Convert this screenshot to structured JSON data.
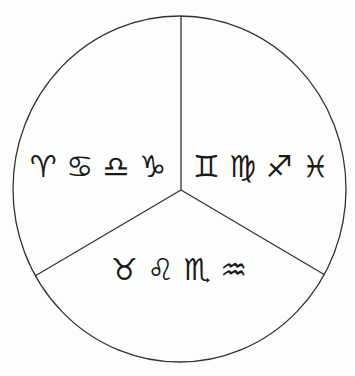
{
  "diagram": {
    "colors": {
      "background": "#fdfdfd",
      "stroke": "#333333",
      "glyph": "#1a1a1a"
    },
    "sectors": [
      {
        "position": "upper-left",
        "glyphs": "♈︎ ♋︎ ♎︎ ♑︎",
        "signs": [
          "Aries",
          "Cancer",
          "Libra",
          "Capricorn"
        ]
      },
      {
        "position": "upper-right",
        "glyphs": "♊︎ ♍︎ ♐︎ ♓︎",
        "signs": [
          "Gemini",
          "Virgo",
          "Sagittarius",
          "Pisces"
        ]
      },
      {
        "position": "bottom",
        "glyphs": "♉︎ ♌︎ ♏︎ ♒︎",
        "signs": [
          "Taurus",
          "Leo",
          "Scorpio",
          "Aquarius"
        ]
      }
    ]
  }
}
